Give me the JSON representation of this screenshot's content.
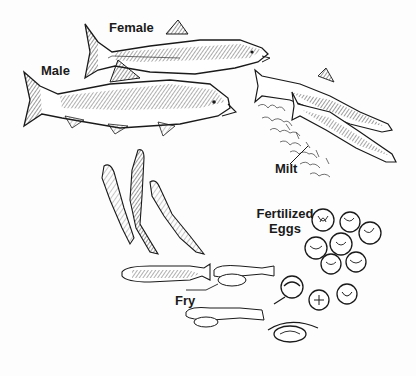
{
  "diagram": {
    "labels": {
      "female": "Female",
      "male": "Male",
      "milt": "Milt",
      "fertilized_eggs_line1": "Fertilized",
      "fertilized_eggs_line2": "Eggs",
      "fry": "Fry"
    },
    "stages": [
      {
        "name": "Adult female salmon",
        "label": "Female"
      },
      {
        "name": "Adult male salmon",
        "label": "Male"
      },
      {
        "name": "Spawning pair releasing milt",
        "label": "Milt"
      },
      {
        "name": "Fertilized egg cluster",
        "label": "Fertilized Eggs"
      },
      {
        "name": "Hatching alevins",
        "label": ""
      },
      {
        "name": "Fry",
        "label": "Fry"
      },
      {
        "name": "Juvenile fish (smolts)",
        "label": ""
      }
    ],
    "colors": {
      "ink": "#1a1a1a",
      "background": "#fdfdfd"
    }
  }
}
